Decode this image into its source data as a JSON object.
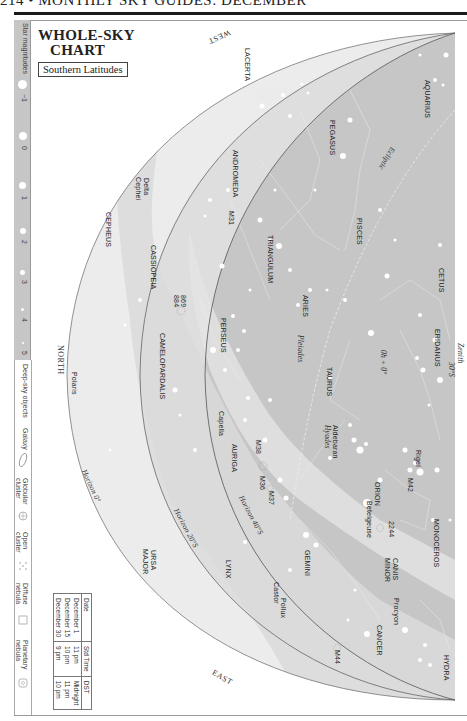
{
  "page": {
    "header": "214 • MONTHLY SKY GUIDES: DECEMBER",
    "title_line1": "WHOLE-SKY",
    "title_line2": "CHART",
    "subtitle": "Southern Latitudes"
  },
  "legend": {
    "magnitudes_label": "Star magnitudes",
    "magnitudes": [
      "−1",
      "0",
      "1",
      "2",
      "3",
      "4",
      "5"
    ],
    "deep_sky_label": "Deep-sky objects",
    "deep_sky": [
      {
        "label": "Galaxy",
        "icon": "galaxy-ellipse-icon"
      },
      {
        "label": "Globular cluster",
        "icon": "globular-cluster-icon"
      },
      {
        "label": "Open cluster",
        "icon": "open-cluster-icon"
      },
      {
        "label": "Diffuse nebula",
        "icon": "diffuse-nebula-icon"
      },
      {
        "label": "Planetary nebula",
        "icon": "planetary-nebula-icon"
      }
    ]
  },
  "time_table": {
    "headers": [
      "Date",
      "Std Time",
      "DST"
    ],
    "rows": [
      [
        "December 1",
        "11 pm",
        "Midnight"
      ],
      [
        "December 15",
        "10 pm",
        "11 pm"
      ],
      [
        "December 30",
        "9 pm",
        "10 pm"
      ]
    ]
  },
  "directions": {
    "west": "WEST",
    "north": "NORTH",
    "east": "EAST",
    "zenith": "Zenith",
    "zenith_lat": "30°S"
  },
  "horizons": {
    "h0": "Horizon 0°",
    "h20": "Horizon 20°S",
    "h40": "Horizon 40°S"
  },
  "markers": {
    "ecliptic": "Ecliptic",
    "origin": "0h + 0°"
  },
  "constellations": [
    "LACERTA",
    "ANDROMEDA",
    "CEPHEUS",
    "CASSIOPEIA",
    "TRIANGULUM",
    "PEGASUS",
    "AQUARIUS",
    "PISCES",
    "ARIES",
    "CETUS",
    "ERIDANUS",
    "TAURUS",
    "PERSEUS",
    "CAMELOPARDALIS",
    "AURIGA",
    "ORION",
    "MONOCEROS",
    "GEMINI",
    "CANIS",
    "MINOR",
    "LYNX",
    "URSA",
    "MAJOR",
    "CANCER",
    "HYDRA"
  ],
  "objects": {
    "delta_cephei_1": "Delta",
    "delta_cephei_2": "Cephei",
    "m31": "M31",
    "ngc869": "869",
    "ngc884": "884",
    "polaris": "Polaris",
    "pleiades": "Pleiades",
    "hyades": "Hyades",
    "aldebaran": "Aldebaran",
    "capella": "Capella",
    "m38": "M38",
    "m36": "M36",
    "m37": "M37",
    "rigel": "Rigel",
    "m42": "M42",
    "betelgeuse": "Betelgeuse",
    "ngc2244": "2244",
    "procyon": "Procyon",
    "castor": "Castor",
    "pollux": "Pollux",
    "m44": "M44"
  },
  "colors": {
    "sky_outer": "#ededed",
    "sky_mid": "#dcdcdc",
    "sky_inner": "#bdbdbd",
    "milky_way": "#d2d2d2",
    "legend_strip": "#c6c6c6",
    "horizon_line": "#777777"
  }
}
